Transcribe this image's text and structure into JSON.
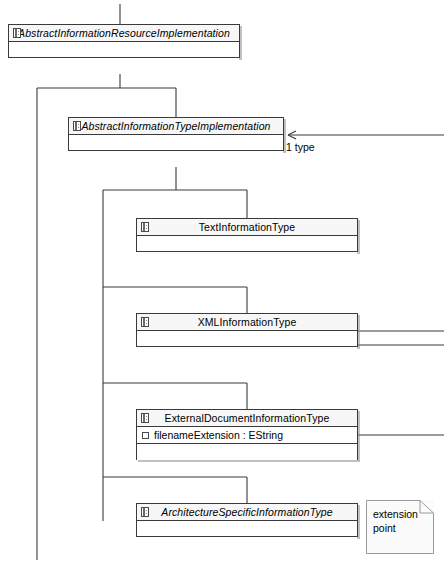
{
  "diagram": {
    "type": "uml-class-diagram",
    "notation": "EMF/Ecore",
    "background": "#ffffff",
    "line_color": "#3a3a3a"
  },
  "classes": [
    {
      "id": "abstract-information-resource-implementation",
      "name": "AbstractInformationResourceImplementation",
      "abstract": true,
      "icon": "eclass-icon",
      "attributes": [],
      "compartments": 2,
      "x": 8,
      "y": 24,
      "width": 232,
      "height": 34
    },
    {
      "id": "abstract-information-type-implementation",
      "name": "AbstractInformationTypeImplementation",
      "abstract": true,
      "icon": "eclass-icon",
      "attributes": [],
      "compartments": 2,
      "x": 68,
      "y": 117,
      "width": 216,
      "height": 34
    },
    {
      "id": "text-information-type",
      "name": "TextInformationType",
      "abstract": false,
      "icon": "eclass-icon",
      "attributes": [],
      "compartments": 2,
      "x": 136,
      "y": 218,
      "width": 222,
      "height": 34
    },
    {
      "id": "xml-information-type",
      "name": "XMLInformationType",
      "abstract": false,
      "icon": "eclass-icon",
      "attributes": [],
      "compartments": 2,
      "x": 136,
      "y": 313,
      "width": 222,
      "height": 34
    },
    {
      "id": "external-document-information-type",
      "name": "ExternalDocumentInformationType",
      "abstract": false,
      "icon": "eclass-icon",
      "attributes": [
        {
          "icon": "eattribute-icon",
          "text": "filenameExtension : EString"
        }
      ],
      "compartments": 2,
      "x": 136,
      "y": 409,
      "width": 222,
      "height": 51
    },
    {
      "id": "architecture-specific-information-type",
      "name": "ArchitectureSpecificInformationType",
      "abstract": true,
      "icon": "eclass-icon",
      "attributes": [],
      "compartments": 2,
      "x": 136,
      "y": 503,
      "width": 222,
      "height": 34
    }
  ],
  "notes": [
    {
      "id": "extension-point-note",
      "text": "extension\npoint",
      "x": 366,
      "y": 500,
      "width": 68,
      "height": 54
    }
  ],
  "association_labels": [
    {
      "id": "type-association-label",
      "multiplicity": "1",
      "role": "type",
      "text": "1   type",
      "x": 286,
      "y": 141
    }
  ],
  "relationships": [
    {
      "type": "generalization",
      "from": "abstract-information-type-implementation",
      "to": "abstract-information-resource-implementation"
    },
    {
      "type": "generalization",
      "from": "offscreen-left-branch",
      "to": "abstract-information-resource-implementation"
    },
    {
      "type": "generalization",
      "from": "text-information-type",
      "to": "abstract-information-type-implementation"
    },
    {
      "type": "generalization",
      "from": "xml-information-type",
      "to": "abstract-information-type-implementation"
    },
    {
      "type": "generalization",
      "from": "external-document-information-type",
      "to": "abstract-information-type-implementation"
    },
    {
      "type": "generalization",
      "from": "architecture-specific-information-type",
      "to": "abstract-information-type-implementation"
    },
    {
      "type": "association",
      "direction": "to-abstract-information-type-implementation",
      "label": "1 type",
      "arrow": "open-arrow-left"
    }
  ]
}
